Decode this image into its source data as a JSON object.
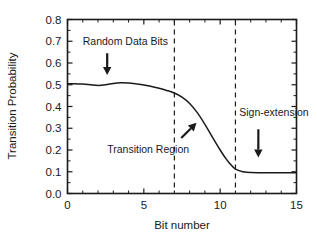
{
  "chart_data": {
    "type": "line",
    "title": "",
    "xlabel": "Bit number",
    "ylabel": "Transition Probability",
    "xlim": [
      0,
      15
    ],
    "ylim": [
      0.0,
      0.8
    ],
    "grid": false,
    "legend": "none",
    "x_ticks": [
      "0",
      "5",
      "10",
      "15"
    ],
    "x_tick_values": [
      0,
      5,
      10,
      15
    ],
    "x_minor_step": 1,
    "y_ticks": [
      "0.0",
      "0.1",
      "0.2",
      "0.3",
      "0.4",
      "0.5",
      "0.6",
      "0.7",
      "0.8"
    ],
    "y_tick_values": [
      0.0,
      0.1,
      0.2,
      0.3,
      0.4,
      0.5,
      0.6,
      0.7,
      0.8
    ],
    "series": [
      {
        "name": "transition probability",
        "color": "#1a1a1a",
        "x": [
          0,
          0.5,
          1,
          1.5,
          2,
          2.5,
          3,
          3.5,
          4,
          4.5,
          5,
          5.5,
          6,
          6.5,
          7,
          7.5,
          8,
          8.5,
          9,
          9.5,
          10,
          10.3,
          10.6,
          11,
          11.5,
          12,
          13,
          14,
          15
        ],
        "values": [
          0.505,
          0.505,
          0.503,
          0.5,
          0.497,
          0.5,
          0.506,
          0.509,
          0.508,
          0.504,
          0.499,
          0.492,
          0.484,
          0.474,
          0.462,
          0.443,
          0.414,
          0.372,
          0.318,
          0.258,
          0.2,
          0.168,
          0.14,
          0.112,
          0.1,
          0.096,
          0.095,
          0.095,
          0.095
        ]
      }
    ],
    "vertical_markers": [
      {
        "name": "transition-region-start",
        "x": 7,
        "style": "dashed"
      },
      {
        "name": "transition-region-end",
        "x": 11,
        "style": "dashed"
      }
    ],
    "annotations": [
      {
        "name": "random-data-bits",
        "text": "Random Data Bits",
        "arrow": "down",
        "text_x": 1.0,
        "text_y": 0.685,
        "arrow_from_x": 2.6,
        "arrow_from_y": 0.645,
        "arrow_to_x": 2.6,
        "arrow_to_y": 0.545
      },
      {
        "name": "transition-region",
        "text": "Transition Region",
        "arrow": "up-right",
        "text_x": 2.6,
        "text_y": 0.185,
        "arrow_from_x": 7.45,
        "arrow_from_y": 0.255,
        "arrow_to_x": 8.45,
        "arrow_to_y": 0.325
      },
      {
        "name": "sign-extension",
        "text": "Sign-extension",
        "arrow": "down",
        "text_x": 11.25,
        "text_y": 0.355,
        "arrow_from_x": 12.5,
        "arrow_from_y": 0.295,
        "arrow_to_x": 12.5,
        "arrow_to_y": 0.165
      }
    ]
  }
}
